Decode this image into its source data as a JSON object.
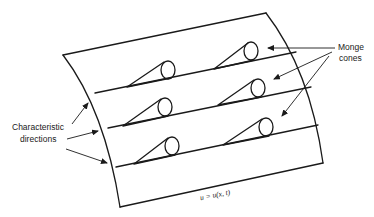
{
  "diagram": {
    "surface_label": "u = u(x, t)",
    "labels": {
      "left": [
        "Characteristic",
        "directions"
      ],
      "right": [
        "Monge",
        "cones"
      ]
    },
    "characteristic_lines": 3,
    "cones_per_line": 2,
    "cone_count": 6,
    "arrows": {
      "characteristic_directions": 3,
      "monge_cones": 3
    }
  }
}
